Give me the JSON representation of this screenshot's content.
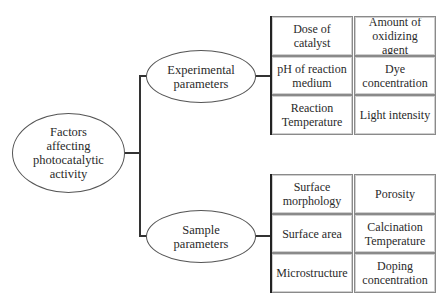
{
  "diagram": {
    "root": {
      "label": "Factors\naffecting\nphotocatalytic\nactivity"
    },
    "branches": [
      {
        "label": "Experimental\nparameters",
        "cells": [
          [
            "Dose of\ncatalyst",
            "Amount of\noxidizing\nagent"
          ],
          [
            "pH of reaction\nmedium",
            "Dye\nconcentration"
          ],
          [
            "Reaction\nTemperature",
            "Light intensity"
          ]
        ]
      },
      {
        "label": "Sample\nparameters",
        "cells": [
          [
            "Surface\nmorphology",
            "Porosity"
          ],
          [
            "Surface area",
            "Calcination\nTemperature"
          ],
          [
            "Microstructure",
            "Doping\nconcentration"
          ]
        ]
      }
    ]
  },
  "colors": {
    "line": "#333333",
    "ellipse_border": "#555555",
    "cell_border": "#8a8a8a",
    "text": "#2a2a2a"
  }
}
